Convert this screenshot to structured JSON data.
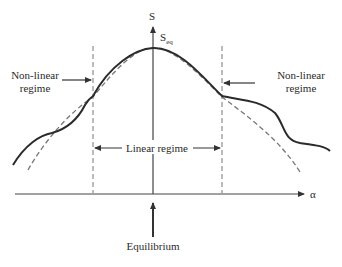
{
  "diagram": {
    "title": "",
    "axes": {
      "y_label": "S",
      "x_label": "α"
    },
    "peak_label": {
      "main": "S",
      "subscript": "eq"
    },
    "labels": {
      "non_linear_left": [
        "Non-linear",
        "regime"
      ],
      "non_linear_right": [
        "Non-linear",
        "regime"
      ],
      "linear": "Linear regime",
      "equilibrium": "Equilibrium"
    },
    "curves": [
      {
        "name": "actual-entropy",
        "style": "solid"
      },
      {
        "name": "quadratic-approximation",
        "style": "dashed"
      }
    ],
    "colors": {
      "line": "#2b2b2b",
      "dashed": "#777777",
      "axis": "#444444"
    }
  }
}
